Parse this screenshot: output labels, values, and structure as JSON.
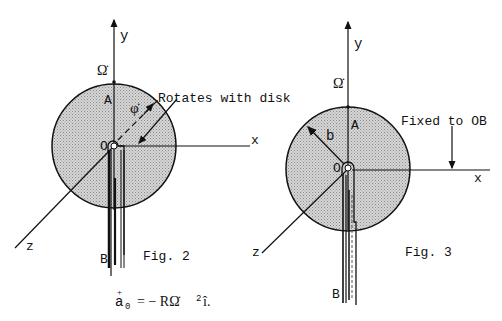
{
  "figures": [
    {
      "id": "fig2",
      "caption": "Fig. 2",
      "axes": {
        "x": "x",
        "y": "y",
        "z": "z"
      },
      "points": {
        "origin": "O",
        "top": "A",
        "bottom": "B"
      },
      "angular_rate": "Ω̇",
      "angle": "φ̇",
      "annotation": "Rotates with disk",
      "equation": {
        "lhs": "a",
        "lhs_sub": "0",
        "rhs": "= − RΩ̇",
        "rhs_sup": "2",
        "unit": "î."
      }
    },
    {
      "id": "fig3",
      "caption": "Fig. 3",
      "axes": {
        "x": "x",
        "y": "y",
        "z": "z"
      },
      "points": {
        "origin": "O",
        "top": "A",
        "bottom": "B"
      },
      "angular_rate": "Ω̇",
      "radius_label": "b",
      "annotation": "Fixed to OB"
    }
  ],
  "colors": {
    "ink": "#111111",
    "disk_fill": "#c8c8c8"
  }
}
